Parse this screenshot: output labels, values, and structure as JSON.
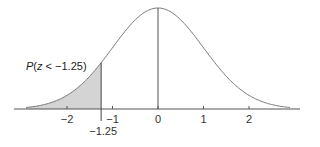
{
  "chart_data": {
    "type": "area",
    "title": "",
    "xlabel": "",
    "ylabel": "",
    "distribution": "standard normal",
    "xlim": [
      -2.9,
      2.9
    ],
    "x_ticks": [
      -2,
      -1,
      0,
      1,
      2
    ],
    "x_tick_labels": [
      "−2",
      "−1",
      "0",
      "1",
      "2"
    ],
    "shaded_region": {
      "from": "-inf",
      "to": -1.25,
      "color": "#d4d4d4"
    },
    "marker": {
      "x": -1.25,
      "label": "−1.25"
    },
    "mean_line": {
      "x": 0
    },
    "annotation": "P(z < −1.25)",
    "grid": false,
    "legend": null
  },
  "colors": {
    "curve": "#777777",
    "axis": "#555555",
    "shade": "#d4d4d4"
  }
}
